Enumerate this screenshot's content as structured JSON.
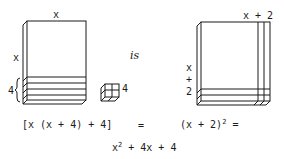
{
  "diagram": {
    "left_box": {
      "top_label": "x",
      "side_label": "x",
      "slab_label": "4",
      "slab_count": 4
    },
    "small_cube": {
      "label": "4"
    },
    "connector_word": "is",
    "right_box": {
      "top_label": "x + 2",
      "side_label_lines": [
        "x",
        "+",
        "2"
      ]
    },
    "equations": {
      "left_expression": "[x (x + 4) + 4]",
      "equals_1": "=",
      "right_expression_base": "(x + 2)",
      "right_expression_exp": "2",
      "equals_2": "=",
      "result_x": "x",
      "result_exp": "2",
      "result_rest": " + 4x + 4"
    },
    "colors": {
      "line": "#1a1a1a",
      "background": "#ffffff"
    }
  }
}
